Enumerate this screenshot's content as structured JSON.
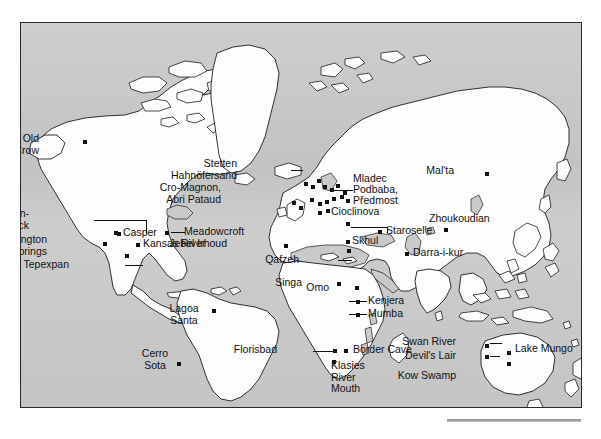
{
  "figure": {
    "kind": "world-map",
    "ocean_color": "#c9c9c9",
    "land_color": "#fdfdfd",
    "outline_color": "#1d1d1d",
    "dot_color": "#111111",
    "frame": {
      "x": 20,
      "y": 22,
      "width": 562,
      "height": 386
    }
  },
  "sites": [
    {
      "id": "old-crow",
      "label": "Old\nCrow",
      "align": "right",
      "lx": 40,
      "ly": 138,
      "dx": 84,
      "dy": 141
    },
    {
      "id": "olsen-chubbuck",
      "label": "Olsen-\nChubbuck",
      "align": "right",
      "lx": 30,
      "ly": 213,
      "dx": 115,
      "dy": 232
    },
    {
      "id": "arlington-springs",
      "label": "Arlington\nSprings",
      "align": "right",
      "lx": 48,
      "ly": 239,
      "dx": 104,
      "dy": 243
    },
    {
      "id": "tepexpan",
      "label": "Tepexpan",
      "align": "right",
      "lx": 70,
      "ly": 264,
      "dx": 126,
      "dy": 255
    },
    {
      "id": "casper",
      "label": "Casper",
      "align": "left",
      "lx": 122,
      "ly": 232,
      "dx": 118,
      "dy": 233
    },
    {
      "id": "kansas-river",
      "label": "Kansas River",
      "align": "left",
      "lx": 142,
      "ly": 243,
      "dx": 137,
      "dy": 244
    },
    {
      "id": "meadowcroft",
      "label": "Meadowcroft",
      "align": "left",
      "lx": 183,
      "ly": 231,
      "dx": 166,
      "dy": 232
    },
    {
      "id": "lagoa-santa",
      "label": "Lagoa\nSanta",
      "align": "center",
      "lx": 183,
      "ly": 308,
      "dx": 213,
      "dy": 310
    },
    {
      "id": "cerro-sota",
      "label": "Cerro\nSota",
      "align": "center",
      "lx": 154,
      "ly": 353,
      "dx": 178,
      "dy": 363
    },
    {
      "id": "stetten",
      "label": "Stetten\nHahnöfersand",
      "align": "right",
      "lx": 238,
      "ly": 163,
      "dx": 305,
      "dy": 183
    },
    {
      "id": "cro-magnon",
      "label": "Cro-Magnon,\nAbri Pataud",
      "align": "right",
      "lx": 222,
      "ly": 187,
      "dx": 293,
      "dy": 202
    },
    {
      "id": "mladec",
      "label": "Mladec",
      "align": "left",
      "lx": 352,
      "ly": 178,
      "dx": 344,
      "dy": 192
    },
    {
      "id": "podbaba",
      "label": "Podbaba,",
      "align": "left",
      "lx": 352,
      "ly": 189,
      "dx": 341,
      "dy": 196
    },
    {
      "id": "predmost",
      "label": "Předmost",
      "align": "left",
      "lx": 352,
      "ly": 200,
      "dx": 347,
      "dy": 200
    },
    {
      "id": "cioclinova",
      "label": "Cioclinova",
      "align": "left",
      "lx": 330,
      "ly": 211,
      "dx": 347,
      "dy": 223
    },
    {
      "id": "staroselie",
      "label": "Starosel'e",
      "align": "left",
      "lx": 385,
      "ly": 230,
      "dx": 379,
      "dy": 231
    },
    {
      "id": "skhul",
      "label": "Skhul",
      "align": "left",
      "lx": 351,
      "ly": 240,
      "dx": 347,
      "dy": 241
    },
    {
      "id": "qafzeh",
      "label": "Qafzeh",
      "align": "right",
      "lx": 300,
      "ly": 259,
      "dx": 348,
      "dy": 250
    },
    {
      "id": "jebel-irhoud",
      "label": "Jebel Irhoud",
      "align": "right",
      "lx": 228,
      "ly": 243,
      "dx": 285,
      "dy": 245
    },
    {
      "id": "maltà",
      "label": "Mal'ta",
      "align": "right",
      "lx": 455,
      "ly": 170,
      "dx": 486,
      "dy": 173
    },
    {
      "id": "zhoukoudian",
      "label": "Zhoukoudian",
      "align": "left",
      "lx": 428,
      "ly": 218,
      "dx": 445,
      "dy": 229
    },
    {
      "id": "darra-i-kur",
      "label": "Darra-i-kur",
      "align": "left",
      "lx": 412,
      "ly": 252,
      "dx": 406,
      "dy": 253
    },
    {
      "id": "singa",
      "label": "Singa",
      "align": "right",
      "lx": 303,
      "ly": 282,
      "dx": 338,
      "dy": 283
    },
    {
      "id": "omo",
      "label": "Omo",
      "align": "right",
      "lx": 330,
      "ly": 287,
      "dx": 356,
      "dy": 287
    },
    {
      "id": "kenjera",
      "label": "Kenjera",
      "align": "left",
      "lx": 367,
      "ly": 300,
      "dx": 357,
      "dy": 301
    },
    {
      "id": "mumba",
      "label": "Mumba",
      "align": "left",
      "lx": 367,
      "ly": 313,
      "dx": 357,
      "dy": 314
    },
    {
      "id": "florisbad",
      "label": "Florisbad",
      "align": "right",
      "lx": 278,
      "ly": 349,
      "dx": 334,
      "dy": 350
    },
    {
      "id": "border-cave",
      "label": "Border Cave",
      "align": "left",
      "lx": 352,
      "ly": 349,
      "dx": 345,
      "dy": 350
    },
    {
      "id": "klasies",
      "label": "Klasies\nRiver\nMouth",
      "align": "left",
      "lx": 330,
      "ly": 365,
      "dx": 333,
      "dy": 361
    },
    {
      "id": "swan-river",
      "label": "Swan River",
      "align": "right",
      "lx": 457,
      "ly": 341,
      "dx": 486,
      "dy": 345
    },
    {
      "id": "devils-lair",
      "label": "Devil's Lair",
      "align": "right",
      "lx": 457,
      "ly": 355,
      "dx": 486,
      "dy": 356
    },
    {
      "id": "kow-swamp",
      "label": "Kow Swamp",
      "align": "right",
      "lx": 457,
      "ly": 375,
      "dx": 508,
      "dy": 363
    },
    {
      "id": "lake-mungo",
      "label": "Lake Mungo",
      "align": "left",
      "lx": 514,
      "ly": 348,
      "dx": 508,
      "dy": 352
    }
  ],
  "cluster_dots": [
    {
      "x": 305,
      "y": 183
    },
    {
      "x": 312,
      "y": 186
    },
    {
      "x": 318,
      "y": 180
    },
    {
      "x": 324,
      "y": 186
    },
    {
      "x": 331,
      "y": 189
    },
    {
      "x": 337,
      "y": 185
    },
    {
      "x": 293,
      "y": 202
    },
    {
      "x": 300,
      "y": 207
    },
    {
      "x": 311,
      "y": 199
    },
    {
      "x": 319,
      "y": 203
    },
    {
      "x": 326,
      "y": 201
    },
    {
      "x": 333,
      "y": 198
    },
    {
      "x": 319,
      "y": 212
    },
    {
      "x": 327,
      "y": 210
    },
    {
      "x": 341,
      "y": 196
    },
    {
      "x": 344,
      "y": 192
    },
    {
      "x": 347,
      "y": 200
    },
    {
      "x": 347,
      "y": 223
    },
    {
      "x": 379,
      "y": 231
    },
    {
      "x": 347,
      "y": 241
    },
    {
      "x": 348,
      "y": 250
    }
  ],
  "leaders": [
    {
      "kind": "h",
      "x": 93,
      "y": 219,
      "len": 52
    },
    {
      "kind": "v",
      "x": 145,
      "y": 219,
      "len": 14
    },
    {
      "kind": "h",
      "x": 106,
      "y": 243,
      "len": 0
    },
    {
      "kind": "h",
      "x": 124,
      "y": 264,
      "len": 18
    },
    {
      "kind": "h",
      "x": 170,
      "y": 231,
      "len": 14
    },
    {
      "kind": "h",
      "x": 290,
      "y": 169,
      "len": 12
    },
    {
      "kind": "h",
      "x": 331,
      "y": 189,
      "len": 21
    },
    {
      "kind": "h",
      "x": 350,
      "y": 226,
      "len": 36
    },
    {
      "kind": "v",
      "x": 386,
      "y": 226,
      "len": 6
    },
    {
      "kind": "h",
      "x": 337,
      "y": 259,
      "len": 14
    },
    {
      "kind": "h",
      "x": 348,
      "y": 300,
      "len": 18
    },
    {
      "kind": "h",
      "x": 348,
      "y": 313,
      "len": 18
    },
    {
      "kind": "h",
      "x": 312,
      "y": 350,
      "len": 22
    },
    {
      "kind": "h",
      "x": 489,
      "y": 342,
      "len": 12
    },
    {
      "kind": "h",
      "x": 489,
      "y": 355,
      "len": 10
    }
  ]
}
